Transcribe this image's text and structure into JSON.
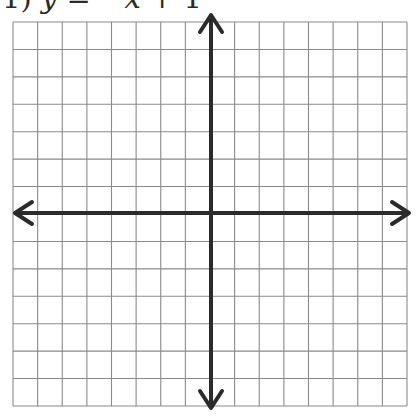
{
  "problem": {
    "number": "1)",
    "var_y": "y",
    "equals": " = ",
    "rhs_sign": "−",
    "var_x": "x",
    "rhs_rest": " + 1",
    "full_text": "1) y = −x + 1"
  },
  "grid": {
    "columns": 16,
    "rows": 14,
    "left": 13,
    "top": 22,
    "right": 407,
    "bottom": 406,
    "line_color": "#8a8a8a",
    "axis_color": "#2b2b2b"
  },
  "axes": {
    "x_axis_y": 213,
    "y_axis_x": 211,
    "x_arrow_left": 14,
    "x_arrow_right": 410,
    "y_arrow_top": 14,
    "y_arrow_bottom": 409
  }
}
